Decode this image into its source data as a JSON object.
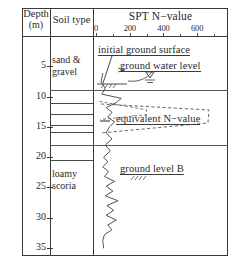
{
  "figure": {
    "columns": [
      {
        "id": "depth",
        "header_line1": "Depth",
        "header_line2": "(m)"
      },
      {
        "id": "soil",
        "header": "Soil type"
      },
      {
        "id": "spt",
        "header": "SPT  N−value"
      }
    ],
    "depth_axis": {
      "unit": "m",
      "ticks": [
        "5",
        "10",
        "15",
        "20",
        "25",
        "30",
        "35"
      ],
      "min": 0,
      "max": 36
    },
    "n_axis": {
      "ticks": [
        "0",
        "200",
        "400",
        "600"
      ],
      "min": 0,
      "max": 700,
      "minor_ticks": 4
    },
    "soil_layers": [
      {
        "label_line1": "sand &",
        "label_line2": "gravel"
      },
      {
        "label_line1": "loamy",
        "label_line2": "scoria"
      }
    ],
    "annotations": [
      {
        "id": "initial-ground-surface",
        "text": "initial ground surface"
      },
      {
        "id": "ground-water-level",
        "text": "ground water level"
      },
      {
        "id": "equivalent-n-value",
        "text": "equivalent N−value"
      },
      {
        "id": "ground-level-b",
        "text": "ground level B"
      }
    ],
    "colors": {
      "frame": "#3a3a3a",
      "curve": "#4a4a4a",
      "text": "#2a2a2a",
      "background": "#ffffff"
    }
  },
  "chart_data": {
    "type": "line",
    "title": "SPT N−value",
    "xlabel": "SPT N−value",
    "ylabel": "Depth (m)",
    "xlim": [
      0,
      700
    ],
    "ylim": [
      36,
      0
    ],
    "grid": false,
    "legend": null,
    "series": [
      {
        "name": "SPT N−value",
        "points": [
          [
            40,
            6.2
          ],
          [
            30,
            7.6
          ],
          [
            55,
            8.6
          ],
          [
            35,
            9.6
          ],
          [
            150,
            10.3
          ],
          [
            120,
            11.0
          ],
          [
            60,
            11.8
          ],
          [
            95,
            12.6
          ],
          [
            70,
            13.4
          ],
          [
            110,
            14.2
          ],
          [
            80,
            15.0
          ],
          [
            60,
            16.0
          ],
          [
            95,
            17.0
          ],
          [
            55,
            18.0
          ],
          [
            85,
            19.0
          ],
          [
            45,
            20.0
          ],
          [
            70,
            20.8
          ],
          [
            40,
            21.6
          ],
          [
            75,
            22.4
          ],
          [
            50,
            23.2
          ],
          [
            110,
            24.0
          ],
          [
            60,
            24.8
          ],
          [
            100,
            25.6
          ],
          [
            55,
            26.4
          ],
          [
            130,
            27.2
          ],
          [
            65,
            28.0
          ],
          [
            105,
            28.8
          ],
          [
            60,
            29.6
          ],
          [
            120,
            30.4
          ],
          [
            70,
            31.2
          ],
          [
            95,
            32.0
          ],
          [
            50,
            32.8
          ],
          [
            40,
            33.8
          ],
          [
            45,
            35.0
          ]
        ]
      },
      {
        "name": "equivalent N−value",
        "style": "dashed",
        "points": [
          [
            20,
            10.8
          ],
          [
            300,
            12.2
          ],
          [
            300,
            13.0
          ],
          [
            25,
            13.8
          ]
        ]
      }
    ],
    "markers": [
      {
        "id": "ground-water-level",
        "symbol": "water-table",
        "depth": 8.4,
        "n": 55
      },
      {
        "id": "initial-ground-surface",
        "symbol": "leader-line",
        "depth": 8.4
      }
    ]
  }
}
